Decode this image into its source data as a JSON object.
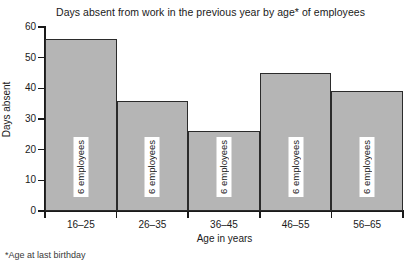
{
  "chart_data": {
    "type": "bar",
    "title": "Days absent from work in the previous year by age* of employees",
    "xlabel": "Age in years",
    "ylabel": "Days absent",
    "categories": [
      "16–25",
      "26–35",
      "36–45",
      "46–55",
      "56–65"
    ],
    "values": [
      56,
      36,
      26,
      45,
      39
    ],
    "ylim": [
      0,
      60
    ],
    "yticks": [
      0,
      10,
      20,
      30,
      40,
      50,
      60
    ],
    "ytick_labels": [
      "0",
      "10",
      "20",
      "30",
      "40",
      "50",
      "60"
    ],
    "grid": false,
    "legend": null,
    "bar_annotations": [
      "6 employees",
      "6 employees",
      "6 employees",
      "6 employees",
      "6 employees"
    ],
    "bar_style": {
      "fill": "#b5b5b5",
      "border": "#2b2b2b",
      "contiguous": true
    }
  },
  "footnote": "*Age at last birthday",
  "axis": {
    "y_title": "Days absent",
    "x_title": "Age in years"
  }
}
